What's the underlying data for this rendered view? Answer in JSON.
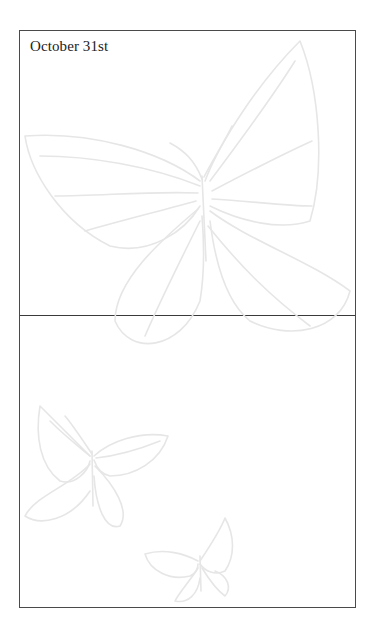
{
  "page": {
    "date_heading": "October 31st"
  },
  "decorations": {
    "large_butterfly": "butterfly-line-art",
    "small_butterfly_left": "butterfly-line-art",
    "small_butterfly_bottom": "butterfly-line-art",
    "art_color": "#e6e6e6",
    "border_color": "#4a4a4a"
  }
}
